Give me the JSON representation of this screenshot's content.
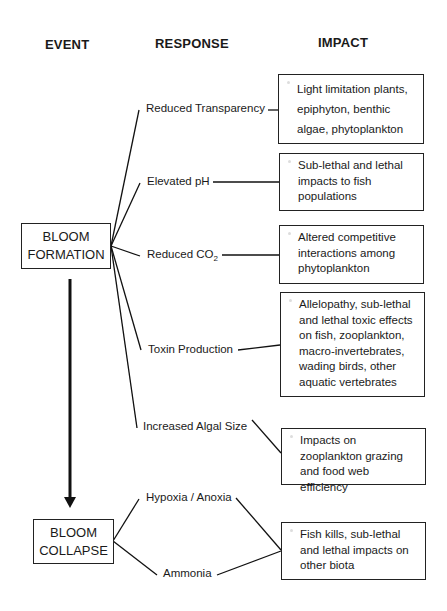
{
  "headers": {
    "event": "EVENT",
    "response": "RESPONSE",
    "impact": "IMPACT"
  },
  "events": {
    "formation": [
      "BLOOM",
      "FORMATION"
    ],
    "collapse": [
      "BLOOM",
      "COLLAPSE"
    ]
  },
  "responses": {
    "reduced_transparency": "Reduced Transparency",
    "elevated_ph": "Elevated pH",
    "reduced_co2_main": "Reduced CO",
    "reduced_co2_sub": "2",
    "toxin_production": "Toxin Production",
    "increased_algal_size": "Increased Algal Size",
    "hypoxia_anoxia": "Hypoxia / Anoxia",
    "ammonia": "Ammonia"
  },
  "impacts": {
    "light_limitation": "Light limitation plants, epiphyton, benthic algae, phytoplankton",
    "fish_populations": "Sub-lethal and lethal impacts to fish populations",
    "competitive_interactions": "Altered competitive interactions among phytoplankton",
    "toxic_effects": "Allelopathy, sub-lethal and lethal toxic effects on fish, zooplankton, macro-invertebrates, wading birds, other aquatic vertebrates",
    "zooplankton_grazing": "Impacts on zooplankton grazing and food web efficiency",
    "fish_kills": "Fish kills, sub-lethal and lethal impacts on other biota"
  }
}
